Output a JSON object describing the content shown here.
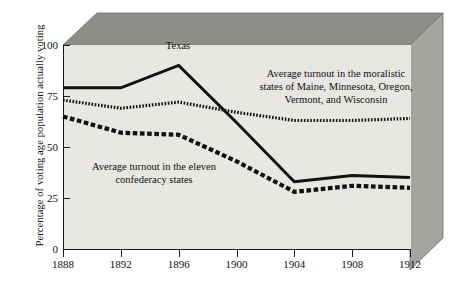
{
  "chart_data": {
    "type": "line",
    "title": "",
    "xlabel": "",
    "ylabel": "Percentage of voting age population actually voting",
    "x": [
      1888,
      1892,
      1896,
      1900,
      1904,
      1908,
      1912
    ],
    "xtick_labels": [
      "1888",
      "1892",
      "1896",
      "1900",
      "1904",
      "1908",
      "1912"
    ],
    "ytick_labels": [
      "0",
      "25",
      "50",
      "75",
      "100"
    ],
    "ytick_values": [
      0,
      25,
      50,
      75,
      100
    ],
    "ylim": [
      0,
      100
    ],
    "xlim": [
      1888,
      1912
    ],
    "grid": false,
    "legend": "annotations-inline",
    "series": [
      {
        "name": "Texas",
        "style": "solid",
        "color": "#111111",
        "values": [
          79,
          79,
          90,
          62,
          33,
          36,
          35
        ]
      },
      {
        "name": "Average turnout in the moralistic states of Maine, Minnesota, Oregon, Vermont, and Wisconsin",
        "style": "fine-dotted",
        "color": "#111111",
        "values": [
          73,
          69,
          72,
          67,
          63,
          63,
          64
        ]
      },
      {
        "name": "Average turnout in the eleven confederacy states",
        "style": "heavy-dashed",
        "color": "#111111",
        "values": [
          65,
          57,
          56,
          43,
          28,
          31,
          30
        ]
      }
    ],
    "annotations": [
      {
        "id": "texas",
        "text": "Texas",
        "x": 1895,
        "y": 95
      },
      {
        "id": "moralistic",
        "text": "Average turnout in the moralistic\nstates of Maine, Minnesota, Oregon,\nVermont, and Wisconsin",
        "x": 1906,
        "y": 82
      },
      {
        "id": "confederacy",
        "text": "Average turnout in the eleven\nconfederacy states",
        "x": 1892,
        "y": 44
      }
    ]
  },
  "style": {
    "plot_background": "#e8e7e3",
    "top_face": "#8f8d88",
    "right_face": "#a6a4a0",
    "axis_color": "#1a1a1a",
    "page_background": "#ffffff"
  }
}
